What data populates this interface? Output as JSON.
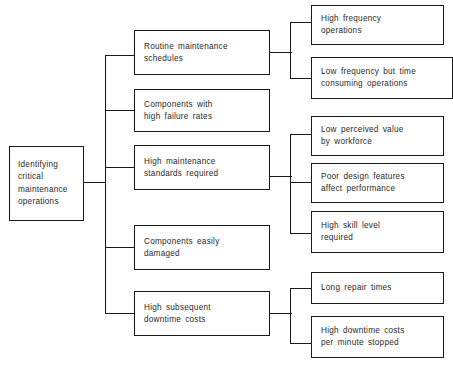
{
  "diagram": {
    "type": "tree-diagram",
    "orientation": "left-to-right",
    "line_color": "#1a1a1a",
    "box_fill": "#ffffff",
    "text_color": "#2a2a2a",
    "root": {
      "id": "root",
      "label": "Identifying\ncritical\nmaintenance\noperations"
    },
    "level2": [
      {
        "id": "routine-maintenance-schedules",
        "label": "Routine  maintenance\nschedules",
        "children": [
          {
            "id": "high-frequency-operations",
            "label": "High  frequency\noperations"
          },
          {
            "id": "low-frequency-time-consuming-operations",
            "label": "Low  frequency  but  time\nconsuming  operations"
          }
        ]
      },
      {
        "id": "components-with-high-failure-rates",
        "label": "Components  with\nhigh  failure  rates",
        "children": []
      },
      {
        "id": "high-maintenance-standards-required",
        "label": "High  maintenance\nstandards  required",
        "children": [
          {
            "id": "low-perceived-value-by-workforce",
            "label": "Low  perceived  value\nby  workforce"
          },
          {
            "id": "poor-design-features-affect-performance",
            "label": "Poor  design  features\naffect  performance"
          },
          {
            "id": "high-skill-level-required",
            "label": "High  skill  level\nrequired"
          }
        ]
      },
      {
        "id": "components-easily-damaged",
        "label": "Components  easily\ndamaged",
        "children": []
      },
      {
        "id": "high-subsequent-downtime-costs",
        "label": "High  subsequent\ndowntime  costs",
        "children": [
          {
            "id": "long-repair-times",
            "label": "Long  repair  times"
          },
          {
            "id": "high-downtime-costs-per-minute-stopped",
            "label": "High  downtime  costs\nper  minute  stopped"
          }
        ]
      }
    ]
  }
}
